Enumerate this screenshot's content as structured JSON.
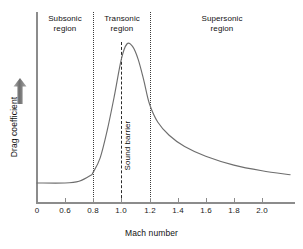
{
  "chart_data": {
    "type": "line",
    "title": "",
    "xlabel": "Mach number",
    "ylabel": "Drag coefficient",
    "xlim": [
      0,
      2.2
    ],
    "ylim": [
      0,
      1
    ],
    "grid": false,
    "legend": "none",
    "xticks": [
      {
        "value": "0",
        "px": 37
      },
      {
        "value": "0.6",
        "px": 65
      },
      {
        "value": "0.8",
        "px": 93
      },
      {
        "value": "1.0",
        "px": 121
      },
      {
        "value": "1.2",
        "px": 150
      },
      {
        "value": "1.4",
        "px": 178
      },
      {
        "value": "1.6",
        "px": 206
      },
      {
        "value": "1.8",
        "px": 234
      },
      {
        "value": "2.0",
        "px": 262
      }
    ],
    "yticks": [],
    "axis_note": "x-axis is compressed between 0 and 0.6; ticks from 0.6 onward are evenly spaced every 0.2 Mach",
    "series": [
      {
        "name": "Drag coefficient",
        "color": "#6e6e6e",
        "points": [
          {
            "x": 0.0,
            "y": 0.104
          },
          {
            "x": 0.6,
            "y": 0.104
          },
          {
            "x": 0.7,
            "y": 0.115
          },
          {
            "x": 0.78,
            "y": 0.15
          },
          {
            "x": 0.8,
            "y": 0.17
          },
          {
            "x": 0.85,
            "y": 0.26
          },
          {
            "x": 0.9,
            "y": 0.43
          },
          {
            "x": 0.95,
            "y": 0.64
          },
          {
            "x": 1.0,
            "y": 0.87
          },
          {
            "x": 1.04,
            "y": 0.965
          },
          {
            "x": 1.08,
            "y": 0.95
          },
          {
            "x": 1.12,
            "y": 0.87
          },
          {
            "x": 1.16,
            "y": 0.74
          },
          {
            "x": 1.2,
            "y": 0.595
          },
          {
            "x": 1.26,
            "y": 0.48
          },
          {
            "x": 1.34,
            "y": 0.4
          },
          {
            "x": 1.45,
            "y": 0.33
          },
          {
            "x": 1.6,
            "y": 0.27
          },
          {
            "x": 1.8,
            "y": 0.215
          },
          {
            "x": 2.0,
            "y": 0.18
          },
          {
            "x": 2.2,
            "y": 0.155
          }
        ]
      }
    ],
    "annotations": [
      {
        "name": "subsonic-region",
        "text_line1": "Subsonic",
        "text_line2": "region",
        "x_center": 0.4
      },
      {
        "name": "transonic-region",
        "text_line1": "Transonic",
        "text_line2": "region",
        "x_center": 1.0
      },
      {
        "name": "supersonic-region",
        "text_line1": "Supersonic",
        "text_line2": "region",
        "x_center": 1.72
      },
      {
        "name": "sound-barrier",
        "text_line1": "Sound barrier",
        "x_center": 1.0
      }
    ],
    "vlines": [
      {
        "name": "mach-0.8-boundary",
        "x": 0.8,
        "style": "dotted",
        "color": "#3a3a3a"
      },
      {
        "name": "mach-1.0-sound-barrier",
        "x": 1.0,
        "style": "dashed",
        "color": "#2b2b2b"
      },
      {
        "name": "mach-1.2-boundary",
        "x": 1.2,
        "style": "dotted",
        "color": "#3a3a3a"
      }
    ]
  },
  "axes": {
    "x_title": "Mach number",
    "y_title": "Drag coefficient",
    "tick_labels": [
      "0",
      "0.6",
      "0.8",
      "1.0",
      "1.2",
      "1.4",
      "1.6",
      "1.8",
      "2.0"
    ]
  },
  "regions": {
    "subsonic": {
      "line1": "Subsonic",
      "line2": "region"
    },
    "transonic": {
      "line1": "Transonic",
      "line2": "region"
    },
    "supersonic": {
      "line1": "Supersonic",
      "line2": "region"
    }
  },
  "markers": {
    "sound_barrier": "Sound barrier"
  },
  "colors": {
    "curve": "#6e6e6e",
    "axis": "#8c8c8c",
    "divider": "#3a3a3a",
    "sound_barrier_line": "#2b2b2b",
    "text": "#111111",
    "arrow": "#8c8c8c",
    "background": "#ffffff"
  }
}
